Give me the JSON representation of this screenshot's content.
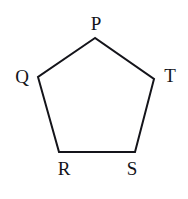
{
  "figure": {
    "name": "pentagon-PQRST",
    "background_color": "#ffffff",
    "stroke_color": "#14141a",
    "stroke_width": 2,
    "label_color": "#14141a",
    "labels": [
      {
        "id": "P",
        "text": "P"
      },
      {
        "id": "Q",
        "text": "Q"
      },
      {
        "id": "R",
        "text": "R"
      },
      {
        "id": "S",
        "text": "S"
      },
      {
        "id": "T",
        "text": "T"
      }
    ]
  },
  "chart_data": {
    "type": "diagram",
    "shape": "pentagon",
    "title": "",
    "xlabel": "",
    "ylabel": "",
    "vertices": [
      {
        "label": "P",
        "x": 95,
        "y": 38
      },
      {
        "label": "Q",
        "x": 38,
        "y": 77
      },
      {
        "label": "R",
        "x": 59,
        "y": 152
      },
      {
        "label": "S",
        "x": 135,
        "y": 152
      },
      {
        "label": "T",
        "x": 154,
        "y": 79
      }
    ],
    "edges": [
      {
        "from": "P",
        "to": "Q"
      },
      {
        "from": "Q",
        "to": "R"
      },
      {
        "from": "R",
        "to": "S"
      },
      {
        "from": "S",
        "to": "T"
      },
      {
        "from": "T",
        "to": "P"
      }
    ],
    "polygon_points": "95,38 38,77 59,152 135,152 154,79",
    "label_positions": [
      {
        "label": "P",
        "x": 95,
        "y": 24
      },
      {
        "label": "Q",
        "x": 22,
        "y": 79
      },
      {
        "label": "R",
        "x": 64,
        "y": 170
      },
      {
        "label": "S",
        "x": 132,
        "y": 170
      },
      {
        "label": "T",
        "x": 170,
        "y": 78
      }
    ],
    "grid": false,
    "legend": false
  }
}
